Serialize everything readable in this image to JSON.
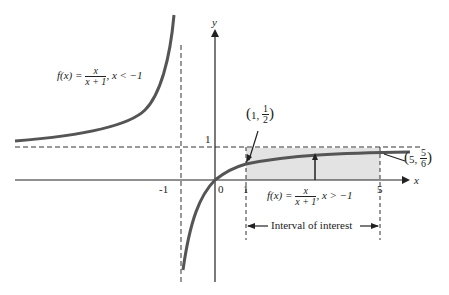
{
  "diagram": {
    "type": "function-graph",
    "function": "f(x) = x/(x+1)",
    "axes": {
      "x_label": "x",
      "y_label": "y"
    },
    "ticks": {
      "x": [
        "-1",
        "0",
        "1",
        "5"
      ],
      "y": [
        "1"
      ]
    },
    "asymptotes": {
      "vertical": "x = -1",
      "horizontal": "y = 1"
    },
    "labels": {
      "left_branch": {
        "prefix": "f(x) = ",
        "num": "x",
        "den": "x + 1",
        "suffix": ", x < −1"
      },
      "right_branch": {
        "prefix": "f(x) = ",
        "num": "x",
        "den": "x + 1",
        "suffix": ", x > −1"
      },
      "point_a": {
        "open": "(",
        "x": "1, ",
        "num": "1",
        "den": "2",
        "close": ")"
      },
      "point_b": {
        "open": "(",
        "x": "5, ",
        "num": "5",
        "den": "6",
        "close": ")"
      },
      "interval": "Interval of interest"
    },
    "colors": {
      "curve": "#555555",
      "shade": "#e3e3e3",
      "axis": "#222222"
    }
  }
}
